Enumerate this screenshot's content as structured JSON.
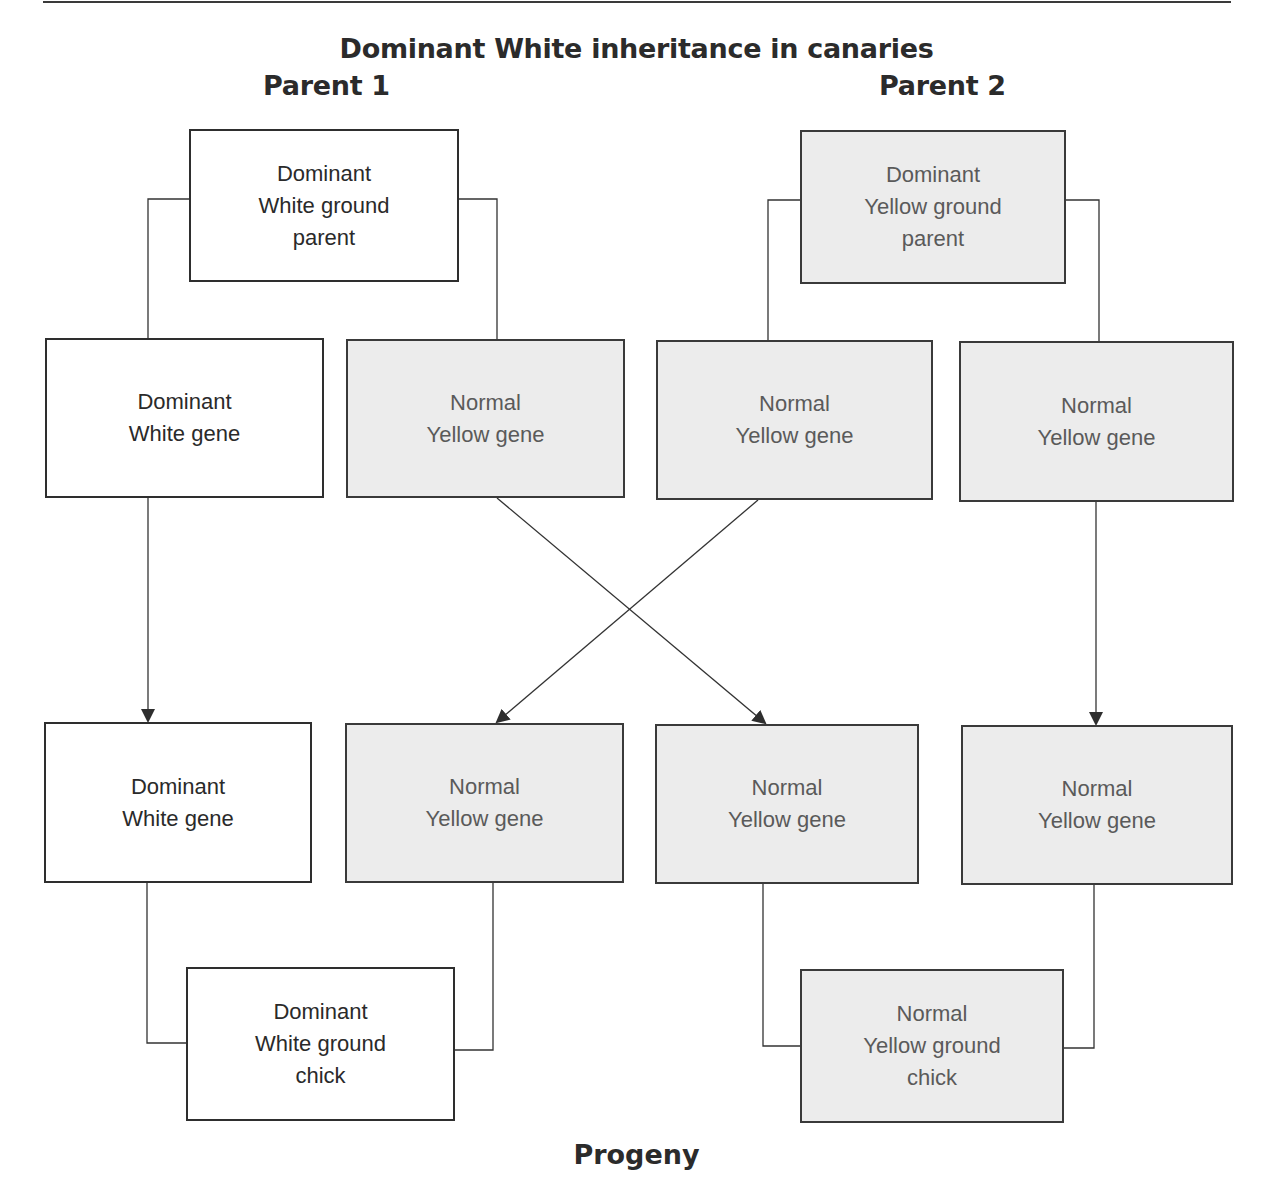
{
  "title": "Dominant White inheritance in canaries",
  "parents": {
    "parent1_label": "Parent 1",
    "parent2_label": "Parent 2"
  },
  "footer": "Progeny",
  "colors": {
    "white_box_fill": "#ffffff",
    "yellow_box_fill": "#ececec",
    "line": "#333333"
  },
  "nodes": {
    "parent1": {
      "line1": "Dominant",
      "line2": "White ground",
      "line3": "parent",
      "type": "white"
    },
    "parent2": {
      "line1": "Dominant",
      "line2": "Yellow ground",
      "line3": "parent",
      "type": "yellow"
    },
    "p1_gene_a": {
      "line1": "Dominant",
      "line2": "White gene",
      "type": "white"
    },
    "p1_gene_b": {
      "line1": "Normal",
      "line2": "Yellow gene",
      "type": "yellow"
    },
    "p2_gene_a": {
      "line1": "Normal",
      "line2": "Yellow gene",
      "type": "yellow"
    },
    "p2_gene_b": {
      "line1": "Normal",
      "line2": "Yellow gene",
      "type": "yellow"
    },
    "chick1_gene_a": {
      "line1": "Dominant",
      "line2": "White gene",
      "type": "white"
    },
    "chick1_gene_b": {
      "line1": "Normal",
      "line2": "Yellow gene",
      "type": "yellow"
    },
    "chick2_gene_a": {
      "line1": "Normal",
      "line2": "Yellow gene",
      "type": "yellow"
    },
    "chick2_gene_b": {
      "line1": "Normal",
      "line2": "Yellow gene",
      "type": "yellow"
    },
    "chick1": {
      "line1": "Dominant",
      "line2": "White ground",
      "line3": "chick",
      "type": "white"
    },
    "chick2": {
      "line1": "Normal",
      "line2": "Yellow ground",
      "line3": "chick",
      "type": "yellow"
    }
  },
  "edges": [
    {
      "from": "parent1",
      "to": "p1_gene_a",
      "kind": "split"
    },
    {
      "from": "parent1",
      "to": "p1_gene_b",
      "kind": "split"
    },
    {
      "from": "parent2",
      "to": "p2_gene_a",
      "kind": "split"
    },
    {
      "from": "parent2",
      "to": "p2_gene_b",
      "kind": "split"
    },
    {
      "from": "p1_gene_a",
      "to": "chick1_gene_a",
      "kind": "arrow"
    },
    {
      "from": "p1_gene_b",
      "to": "chick2_gene_a",
      "kind": "arrow"
    },
    {
      "from": "p2_gene_a",
      "to": "chick1_gene_b",
      "kind": "arrow"
    },
    {
      "from": "p2_gene_b",
      "to": "chick2_gene_b",
      "kind": "arrow"
    },
    {
      "from": "chick1_gene_a",
      "to": "chick1",
      "kind": "merge"
    },
    {
      "from": "chick1_gene_b",
      "to": "chick1",
      "kind": "merge"
    },
    {
      "from": "chick2_gene_a",
      "to": "chick2",
      "kind": "merge"
    },
    {
      "from": "chick2_gene_b",
      "to": "chick2",
      "kind": "merge"
    }
  ]
}
